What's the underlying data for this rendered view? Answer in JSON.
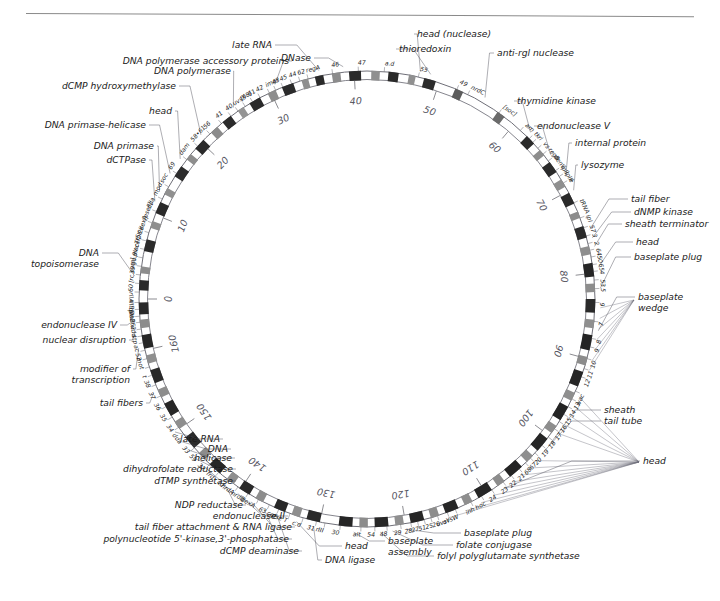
{
  "figure": {
    "kind": "circular-genome-map",
    "units": "kilobase coordinates",
    "circle": {
      "cx": 367,
      "cy": 299,
      "r_outer": 228,
      "r_inner": 219
    },
    "top_rule": true
  },
  "coordinate_ticks": [
    {
      "label": "0",
      "kb": 0
    },
    {
      "label": "10",
      "kb": 10
    },
    {
      "label": "20",
      "kb": 20
    },
    {
      "label": "30",
      "kb": 30
    },
    {
      "label": "40",
      "kb": 40
    },
    {
      "label": "50",
      "kb": 50
    },
    {
      "label": "60",
      "kb": 60
    },
    {
      "label": "70",
      "kb": 70
    },
    {
      "label": "80",
      "kb": 80
    },
    {
      "label": "90",
      "kb": 90
    },
    {
      "label": "100",
      "kb": 100
    },
    {
      "label": "110",
      "kb": 110
    },
    {
      "label": "120",
      "kb": 120
    },
    {
      "label": "130",
      "kb": 130
    },
    {
      "label": "140",
      "kb": 140
    },
    {
      "label": "150",
      "kb": 150
    },
    {
      "label": "160",
      "kb": 160
    }
  ],
  "function_labels": [
    {
      "id": "late-rna",
      "text": "late RNA"
    },
    {
      "id": "dnase",
      "text": "DNase"
    },
    {
      "id": "head-nuclease",
      "text": "head (nuclease)"
    },
    {
      "id": "thioredoxin",
      "text": "thioredoxin"
    },
    {
      "id": "anti-rgl-nuclease",
      "text": "anti-rgl nuclease"
    },
    {
      "id": "thymidine-kinase",
      "text": "thymidine kinase"
    },
    {
      "id": "endonuclease-v",
      "text": "endonuclease V"
    },
    {
      "id": "internal-protein",
      "text": "internal protein"
    },
    {
      "id": "lysozyme",
      "text": "lysozyme"
    },
    {
      "id": "tail-fiber",
      "text": "tail fiber"
    },
    {
      "id": "dnmp-kinase",
      "text": "dNMP kinase"
    },
    {
      "id": "sheath-terminator",
      "text": "sheath terminator"
    },
    {
      "id": "head-right",
      "text": "head"
    },
    {
      "id": "baseplate-plug-right",
      "text": "baseplate plug"
    },
    {
      "id": "baseplate-wedge",
      "text": "baseplate\nwedge"
    },
    {
      "id": "sheath",
      "text": "sheath"
    },
    {
      "id": "tail-tube",
      "text": "tail tube"
    },
    {
      "id": "head-lower-right",
      "text": "head"
    },
    {
      "id": "baseplate-plug-bottom",
      "text": "baseplate plug"
    },
    {
      "id": "folate-conjugase",
      "text": "folate conjugase"
    },
    {
      "id": "folyl-polyglutamate",
      "text": "folyl polyglutamate synthetase"
    },
    {
      "id": "baseplate-assembly",
      "text": "baseplate\nassembly"
    },
    {
      "id": "dna-ligase",
      "text": "DNA ligase"
    },
    {
      "id": "head-bottom",
      "text": "head"
    },
    {
      "id": "dcmp-deaminase",
      "text": "dCMP deaminase"
    },
    {
      "id": "polynucleotide-kinase",
      "text": "polynucleotide 5'-kinase,3'-phosphatase"
    },
    {
      "id": "tail-fiber-attachment",
      "text": "tail fiber attachment & RNA ligase"
    },
    {
      "id": "endonuclease-ii",
      "text": "endonuclease II"
    },
    {
      "id": "ndp-reductase",
      "text": "NDP reductase"
    },
    {
      "id": "dtmp-synthetase",
      "text": "dTMP synthetase"
    },
    {
      "id": "dihydrofolate-reductase",
      "text": "dihydrofolate reductase"
    },
    {
      "id": "helicase",
      "text": "helicase"
    },
    {
      "id": "dna-left",
      "text": "DNA"
    },
    {
      "id": "late-rna-left",
      "text": "late RNA"
    },
    {
      "id": "tail-fibers",
      "text": "tail fibers"
    },
    {
      "id": "modifier-of-transcription",
      "text": "modifier of\ntranscription"
    },
    {
      "id": "nuclear-disruption",
      "text": "nuclear disruption"
    },
    {
      "id": "endonuclease-iv",
      "text": "endonuclease IV"
    },
    {
      "id": "dna-topoisomerase",
      "text": "DNA\ntopoisomerase"
    },
    {
      "id": "dctpase",
      "text": "dCTPase"
    },
    {
      "id": "dna-primase",
      "text": "DNA primase"
    },
    {
      "id": "dna-primase-helicase",
      "text": "DNA primase-helicase"
    },
    {
      "id": "head-left",
      "text": "head"
    },
    {
      "id": "dcmp-hydroxymethylase",
      "text": "dCMP hydroxymethylase"
    },
    {
      "id": "dna-polymerase",
      "text": "DNA polymerase"
    },
    {
      "id": "dna-pol-accessory",
      "text": "DNA polymerase accessory proteins"
    }
  ],
  "gene_ticks": [
    {
      "text": "45"
    },
    {
      "text": "44"
    },
    {
      "text": "62"
    },
    {
      "text": "regA"
    },
    {
      "text": "46"
    },
    {
      "text": "47"
    },
    {
      "text": "a.d"
    },
    {
      "text": "55"
    },
    {
      "text": "49"
    },
    {
      "text": "nrdC"
    },
    {
      "text": "[soc]"
    },
    {
      "text": "arn"
    },
    {
      "text": "tk"
    },
    {
      "text": "rl"
    },
    {
      "text": "vs"
    },
    {
      "text": "regB"
    },
    {
      "text": "denV"
    },
    {
      "text": "ipII"
    },
    {
      "text": "ipIII"
    },
    {
      "text": "e"
    },
    {
      "text": "tRNA"
    },
    {
      "text": "ipI"
    },
    {
      "text": "57"
    },
    {
      "text": "3"
    },
    {
      "text": "2"
    },
    {
      "text": "64"
    },
    {
      "text": "50"
    },
    {
      "text": "65"
    },
    {
      "text": "4"
    },
    {
      "text": "53"
    },
    {
      "text": "5"
    },
    {
      "text": "6"
    },
    {
      "text": "7"
    },
    {
      "text": "8"
    },
    {
      "text": "9"
    },
    {
      "text": "10"
    },
    {
      "text": "11"
    },
    {
      "text": "12"
    },
    {
      "text": "wac"
    },
    {
      "text": "13"
    },
    {
      "text": "14"
    },
    {
      "text": "15"
    },
    {
      "text": "16"
    },
    {
      "text": "17"
    },
    {
      "text": "18"
    },
    {
      "text": "19"
    },
    {
      "text": "20"
    },
    {
      "text": "67"
    },
    {
      "text": "68"
    },
    {
      "text": "21"
    },
    {
      "text": "22"
    },
    {
      "text": "23"
    },
    {
      "text": "24"
    },
    {
      "text": "hoc"
    },
    {
      "text": "inh"
    },
    {
      "text": "uvsW"
    },
    {
      "text": "uvsY"
    },
    {
      "text": "26"
    },
    {
      "text": "25"
    },
    {
      "text": "51"
    },
    {
      "text": "27"
    },
    {
      "text": "28"
    },
    {
      "text": "29"
    },
    {
      "text": "48"
    },
    {
      "text": "54"
    },
    {
      "text": "alt"
    },
    {
      "text": "30"
    },
    {
      "text": "rIII"
    },
    {
      "text": "31"
    },
    {
      "text": "c.d"
    },
    {
      "text": "pse T"
    },
    {
      "text": "cef"
    },
    {
      "text": "63"
    },
    {
      "text": "dexA"
    },
    {
      "text": "nrdB"
    },
    {
      "text": "nrdA"
    },
    {
      "text": "td"
    },
    {
      "text": "frd"
    },
    {
      "text": "32"
    },
    {
      "text": "59"
    },
    {
      "text": "33"
    },
    {
      "text": "dda"
    },
    {
      "text": "34"
    },
    {
      "text": "35"
    },
    {
      "text": "36"
    },
    {
      "text": "37"
    },
    {
      "text": "38"
    },
    {
      "text": "t"
    },
    {
      "text": "mot"
    },
    {
      "text": "52"
    },
    {
      "text": "ac"
    },
    {
      "text": "stp"
    },
    {
      "text": "ndd"
    },
    {
      "text": "pla262"
    },
    {
      "text": "denB"
    },
    {
      "text": "DI"
    },
    {
      "text": "rIIB"
    },
    {
      "text": "rIIA"
    },
    {
      "text": "60"
    },
    {
      "text": "[rc sum]"
    },
    {
      "text": "39"
    },
    {
      "text": "go.9v"
    },
    {
      "text": "placTr5x"
    },
    {
      "text": "cef."
    },
    {
      "text": "pl2k"
    },
    {
      "text": "dexA"
    },
    {
      "text": "[pseF]"
    },
    {
      "text": "dda"
    },
    {
      "text": "mod"
    },
    {
      "text": "soc"
    },
    {
      "text": "69"
    },
    {
      "text": "dam"
    },
    {
      "text": "58•61"
    },
    {
      "text": "56"
    },
    {
      "text": "41"
    },
    {
      "text": "40"
    },
    {
      "text": "uvsX"
    },
    {
      "text": "[98]"
    },
    {
      "text": "61"
    },
    {
      "text": "42"
    },
    {
      "text": "imm"
    },
    {
      "text": "43"
    }
  ]
}
